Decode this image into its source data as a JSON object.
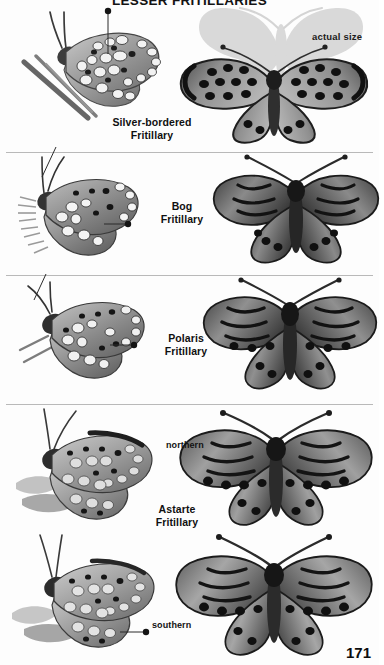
{
  "page": {
    "title": "LESSER FRITILLARIES",
    "number": "171",
    "background_color": "#fdfdfd",
    "divider_color": "#b9b9b9"
  },
  "annotations": {
    "actual_size_label": "actual size",
    "ghost_color": "#d8d8d8"
  },
  "plates": [
    {
      "id": "silver-bordered-fritillary",
      "label_lines": [
        "Silver-bordered",
        "Fritillary"
      ],
      "views": [
        "ventral-side-view",
        "dorsal-spread-view"
      ],
      "has_actual_size_ghost": true
    },
    {
      "id": "bog-fritillary",
      "label_lines": [
        "Bog",
        "Fritillary"
      ],
      "views": [
        "ventral-side-view",
        "dorsal-spread-view"
      ],
      "has_actual_size_ghost": false
    },
    {
      "id": "polaris-fritillary",
      "label_lines": [
        "Polaris",
        "Fritillary"
      ],
      "views": [
        "ventral-side-view",
        "dorsal-spread-view"
      ],
      "has_actual_size_ghost": false
    },
    {
      "id": "astarte-fritillary",
      "label_lines": [
        "Astarte",
        "Fritillary"
      ],
      "views": [
        "ventral-side-view",
        "dorsal-spread-view"
      ],
      "has_actual_size_ghost": false,
      "forms": [
        {
          "id": "northern",
          "label": "northern"
        },
        {
          "id": "southern",
          "label": "southern"
        }
      ]
    }
  ]
}
